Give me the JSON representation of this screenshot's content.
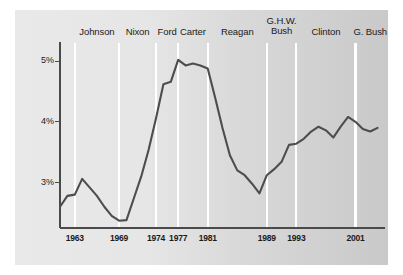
{
  "chart_data": {
    "type": "line",
    "title": "",
    "subtitle": "",
    "xlabel": "",
    "ylabel": "",
    "xlim": [
      1961,
      2005
    ],
    "ylim": [
      2.25,
      5.25
    ],
    "grid": "vertical gridlines at presidential term boundaries",
    "legend": "none",
    "y_ticks": [
      {
        "value": 3,
        "label": "3%"
      },
      {
        "value": 4,
        "label": "4%"
      },
      {
        "value": 5,
        "label": "5%"
      }
    ],
    "x_ticks": [
      {
        "value": 1963,
        "label": "1963"
      },
      {
        "value": 1969,
        "label": "1969"
      },
      {
        "value": 1974,
        "label": "1974"
      },
      {
        "value": 1977,
        "label": "1977"
      },
      {
        "value": 1981,
        "label": "1981"
      },
      {
        "value": 1989,
        "label": "1989"
      },
      {
        "value": 1993,
        "label": "1993"
      },
      {
        "value": 2001,
        "label": "2001"
      }
    ],
    "era_bands": [
      {
        "label": "Johnson",
        "label_line2": "",
        "start": 1963,
        "end": 1969,
        "center": 1966.0
      },
      {
        "label": "Nixon",
        "label_line2": "",
        "start": 1969,
        "end": 1974,
        "center": 1971.5
      },
      {
        "label": "Ford",
        "label_line2": "",
        "start": 1974,
        "end": 1977,
        "center": 1975.5
      },
      {
        "label": "Carter",
        "label_line2": "",
        "start": 1977,
        "end": 1981,
        "center": 1979.0
      },
      {
        "label": "Reagan",
        "label_line2": "",
        "start": 1981,
        "end": 1989,
        "center": 1985.0
      },
      {
        "label": "G.H.W.",
        "label_line2": "Bush",
        "start": 1989,
        "end": 1993,
        "center": 1991.0
      },
      {
        "label": "Clinton",
        "label_line2": "",
        "start": 1993,
        "end": 2001,
        "center": 1997.0
      },
      {
        "label": "G. Bush",
        "label_line2": "",
        "start": 2001,
        "end": 2005,
        "center": 2003.0
      }
    ],
    "series": [
      {
        "name": "rate",
        "color": "#4d4d4d",
        "x": [
          1961,
          1962,
          1963,
          1964,
          1965,
          1966,
          1967,
          1968,
          1969,
          1970,
          1971,
          1972,
          1973,
          1974,
          1975,
          1976,
          1977,
          1978,
          1979,
          1980,
          1981,
          1982,
          1983,
          1984,
          1985,
          1986,
          1987,
          1988,
          1989,
          1990,
          1991,
          1992,
          1993,
          1994,
          1995,
          1996,
          1997,
          1998,
          1999,
          2000,
          2001,
          2002,
          2003,
          2004
        ],
        "values": [
          2.6,
          2.78,
          2.8,
          3.06,
          2.92,
          2.78,
          2.6,
          2.45,
          2.37,
          2.38,
          2.74,
          3.1,
          3.54,
          4.06,
          4.62,
          4.66,
          5.02,
          4.93,
          4.96,
          4.93,
          4.88,
          4.4,
          3.9,
          3.45,
          3.2,
          3.12,
          2.98,
          2.82,
          3.12,
          3.22,
          3.34,
          3.62,
          3.64,
          3.72,
          3.84,
          3.92,
          3.86,
          3.74,
          3.92,
          4.08,
          4.0,
          3.88,
          3.84,
          3.9
        ]
      }
    ],
    "colors": {
      "line": "#4d4d4d",
      "axis": "#4a4a4a",
      "gridline": "#ffffff",
      "panel_light": "#e9e9e9",
      "panel_dark": "#c9c9c9",
      "text": "#1a1a1a"
    }
  }
}
